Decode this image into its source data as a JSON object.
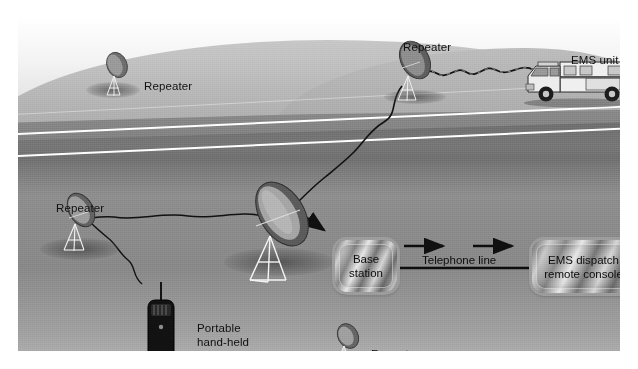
{
  "diagram": {
    "type": "schematic illustration",
    "background_colors": {
      "page": "#ffffff",
      "sky": "#f2f2f2",
      "hill": "#b4b4b4",
      "ground": "#8e8e8e",
      "road": "#747474",
      "road_line": "#ffffff",
      "label_text": "#111111",
      "box_border": "#9d9d9d"
    },
    "labels": [
      {
        "id": "repeater-hill-left",
        "text": "Repeater",
        "x": 126,
        "y": 62
      },
      {
        "id": "repeater-hill-right",
        "text": "Repeater",
        "x": 385,
        "y": 23
      },
      {
        "id": "ems-unit",
        "text": "EMS unit",
        "x": 553,
        "y": 36
      },
      {
        "id": "repeater-fore-left",
        "text": "Repeater",
        "x": 38,
        "y": 184
      },
      {
        "id": "repeater-fore-bottom",
        "text": "Repeater",
        "x": 353,
        "y": 330
      }
    ],
    "multiline_labels": [
      {
        "id": "portable-radio",
        "lines": [
          "Portable",
          "hand-held",
          "radio"
        ],
        "x": 179,
        "y": 304
      }
    ],
    "boxes": [
      {
        "id": "base-station",
        "lines": [
          "Base",
          "station"
        ],
        "x": 317,
        "y": 222,
        "w": 62,
        "h": 52
      },
      {
        "id": "ems-dispatch-remote-console",
        "lines": [
          "EMS dispatch",
          "remote console"
        ],
        "x": 514,
        "y": 222,
        "w": 103,
        "h": 53
      }
    ],
    "connector_label": {
      "id": "telephone-line",
      "text": "Telephone line",
      "x": 404,
      "y": 236
    },
    "devices": [
      {
        "id": "dish-hill-left",
        "kind": "satellite-dish",
        "x": 96,
        "y": 45,
        "scale": 0.46
      },
      {
        "id": "dish-hill-right",
        "kind": "satellite-dish",
        "x": 396,
        "y": 33,
        "scale": 0.8
      },
      {
        "id": "dish-fore-left",
        "kind": "satellite-dish",
        "x": 57,
        "y": 188,
        "scale": 0.62
      },
      {
        "id": "dish-fore-main",
        "kind": "satellite-dish",
        "x": 247,
        "y": 178,
        "scale": 1.0
      },
      {
        "id": "dish-fore-bottom",
        "kind": "satellite-dish",
        "x": 323,
        "y": 315,
        "scale": 0.45
      },
      {
        "id": "ambulance",
        "kind": "ems-vehicle",
        "x": 520,
        "y": 56,
        "scale": 1.0
      },
      {
        "id": "handheld-radio",
        "kind": "portable-radio",
        "x": 140,
        "y": 282,
        "scale": 1.0
      }
    ],
    "signal_paths": [
      {
        "id": "signal-ems-to-hill-repeater",
        "from": "ambulance",
        "to": "dish-hill-right"
      },
      {
        "id": "signal-hill-to-main-dish",
        "from": "dish-hill-right",
        "to": "dish-fore-main"
      },
      {
        "id": "signal-main-to-fore-left",
        "from": "dish-fore-main",
        "to": "dish-fore-left"
      },
      {
        "id": "signal-radio-to-fore-left",
        "from": "handheld-radio",
        "to": "dish-fore-left"
      }
    ],
    "arrows": [
      {
        "id": "arrow-dish-to-base",
        "from": "dish-fore-main",
        "to": "base-station"
      },
      {
        "id": "arrow-telephone-1",
        "from": "base-station",
        "to": "ems-dispatch-remote-console"
      },
      {
        "id": "arrow-telephone-2",
        "from": "base-station",
        "to": "ems-dispatch-remote-console"
      }
    ]
  }
}
